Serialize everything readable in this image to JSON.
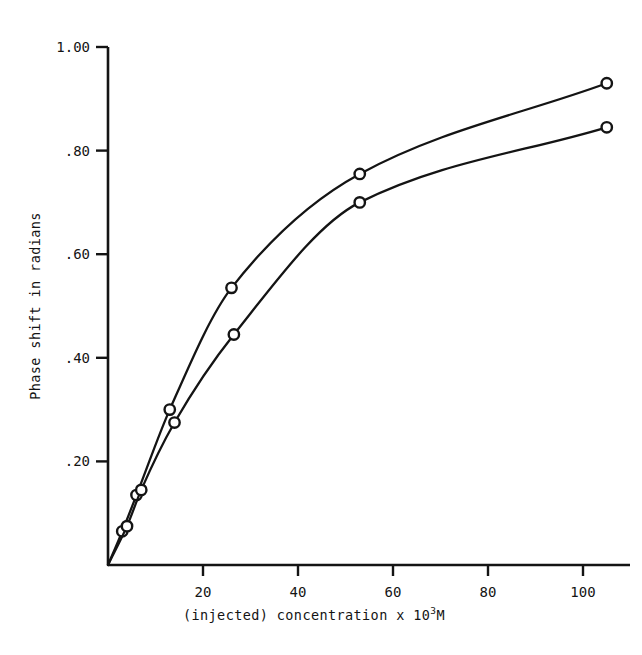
{
  "chart_data": {
    "type": "line",
    "title": "",
    "xlabel": "(injected) concentration x 10³M",
    "xlabel_parts": {
      "lead": "(injected) concentration x 10",
      "exponent": "3",
      "trail": "M"
    },
    "ylabel": "Phase shift in radians",
    "xlim": [
      0,
      110
    ],
    "ylim": [
      0,
      1.0
    ],
    "xticks": [
      20,
      40,
      60,
      80,
      100
    ],
    "xtick_labels": [
      "20",
      "40",
      "60",
      "80",
      "100"
    ],
    "yticks": [
      0.2,
      0.4,
      0.6,
      0.8,
      1.0
    ],
    "ytick_labels": [
      ".20",
      ".40",
      ".60",
      ".80",
      "1.00"
    ],
    "grid": false,
    "legend": "none",
    "marker": "open-circle",
    "line_color": "#141414",
    "background_color": "#ffffff",
    "series": [
      {
        "name": "upper curve",
        "marker": "open-circle",
        "x": [
          0,
          3,
          6,
          13,
          26,
          53,
          105
        ],
        "values": [
          0.0,
          0.065,
          0.135,
          0.3,
          0.535,
          0.755,
          0.93
        ]
      },
      {
        "name": "lower curve",
        "marker": "open-circle",
        "x": [
          0,
          4,
          7,
          14,
          26.5,
          53,
          105
        ],
        "values": [
          0.0,
          0.075,
          0.145,
          0.275,
          0.445,
          0.7,
          0.845
        ]
      }
    ]
  }
}
